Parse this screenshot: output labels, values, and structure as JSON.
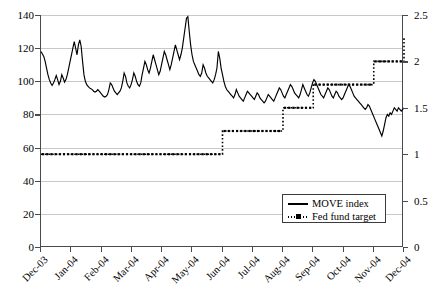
{
  "chart_data": {
    "type": "line",
    "title": "",
    "xlabel": "",
    "ylabel": "",
    "ylim": [
      0,
      140
    ],
    "y2lim": [
      0,
      2.5
    ],
    "grid": true,
    "legend_position": "inside-bottom-right",
    "x_tick_labels": [
      "Dec-03",
      "Jan-04",
      "Feb-04",
      "Mar-04",
      "Apr-04",
      "May-04",
      "Jun-04",
      "Jul-04",
      "Aug-04",
      "Sep-04",
      "Oct-04",
      "Nov-04",
      "Dec-04"
    ],
    "y_tick_labels": [
      "0",
      "20",
      "40",
      "60",
      "80",
      "100",
      "120",
      "140"
    ],
    "y2_tick_labels": [
      "0",
      "0.5",
      "1",
      "1.5",
      "2",
      "2.5"
    ],
    "series": [
      {
        "name": "MOVE index",
        "axis": "left",
        "style": "solid",
        "color": "#000000",
        "values": [
          118,
          116.5,
          115,
          112,
          108,
          104,
          101,
          99,
          97.5,
          99,
          101,
          103.5,
          101,
          98,
          100,
          104,
          102,
          99.5,
          101,
          104,
          108,
          112,
          116,
          120,
          124,
          120,
          116,
          122,
          125,
          121,
          112,
          104,
          100,
          98,
          97,
          96,
          95.5,
          95,
          94,
          93.5,
          94,
          95,
          94,
          93,
          92,
          91,
          90.5,
          91,
          92,
          95,
          99,
          98,
          96,
          94,
          93,
          92,
          93,
          94,
          96,
          100,
          105,
          103,
          99,
          97,
          96,
          98,
          101,
          105,
          103,
          100,
          98,
          97,
          99,
          104,
          108,
          112,
          110,
          107,
          105,
          108,
          112,
          116,
          113,
          110,
          107,
          104,
          106,
          110,
          114,
          118,
          116,
          113,
          110,
          107,
          110,
          114,
          118,
          122,
          119,
          116,
          113,
          116,
          120,
          126,
          132,
          138,
          139,
          130,
          122,
          116,
          112,
          110,
          108,
          106,
          104,
          103,
          105,
          110,
          108,
          105,
          103,
          102,
          101,
          100,
          99,
          101,
          104,
          108,
          118,
          114,
          108,
          104,
          100,
          97,
          95,
          94,
          93,
          92,
          91,
          90,
          92,
          95,
          93,
          91,
          90,
          89,
          88,
          90,
          92,
          94,
          93,
          92,
          91,
          90,
          89,
          91,
          93,
          92,
          90,
          89,
          88,
          87,
          88,
          90,
          92,
          91,
          90,
          89,
          88,
          90,
          92,
          94,
          96,
          95,
          93,
          91,
          90,
          92,
          94,
          96,
          98,
          97,
          95,
          93,
          92,
          91,
          90,
          92,
          95,
          98,
          96,
          94,
          92,
          91,
          93,
          96,
          99,
          101,
          100,
          98,
          96,
          94,
          92,
          91,
          90,
          92,
          94,
          96,
          95,
          93,
          91,
          90,
          92,
          94,
          93,
          91,
          90,
          89,
          90,
          92,
          94,
          96,
          98,
          97,
          95,
          93,
          91,
          90,
          89,
          88,
          87,
          86,
          85,
          84,
          83,
          84,
          86,
          85,
          83,
          81,
          79,
          77,
          75,
          73,
          71,
          69,
          67,
          70,
          74,
          78,
          80,
          79,
          81,
          80,
          82,
          84,
          83,
          82,
          84,
          83,
          82,
          83,
          84
        ],
        "min": 67,
        "max": 139,
        "first": 118,
        "last": 84
      },
      {
        "name": "Fed fund target",
        "axis": "right",
        "style": "dotted-square-step",
        "color": "#000000",
        "steps": [
          {
            "from": "Dec-03",
            "to": "Jun-04",
            "rate": 1.0
          },
          {
            "from": "Jun-04",
            "to": "Aug-04",
            "rate": 1.25
          },
          {
            "from": "Aug-04",
            "to": "Sep-04",
            "rate": 1.5
          },
          {
            "from": "Sep-04",
            "to": "Nov-04",
            "rate": 1.75
          },
          {
            "from": "Nov-04",
            "to": "Dec-04",
            "rate": 2.0
          },
          {
            "from": "Dec-04",
            "to": "Dec-04",
            "rate": 2.25
          }
        ],
        "values": [
          1.0,
          1.25,
          1.5,
          1.75,
          2.0,
          2.25
        ]
      }
    ],
    "legend": [
      {
        "label": "MOVE index",
        "style": "solid-line"
      },
      {
        "label": "Fed fund target",
        "style": "dotted-line-square-marker"
      }
    ]
  }
}
